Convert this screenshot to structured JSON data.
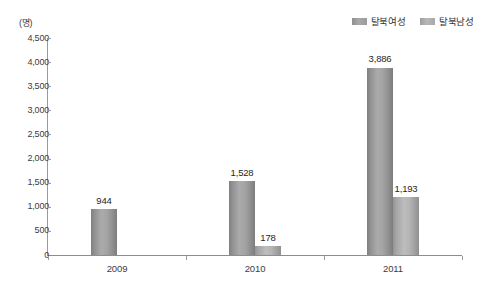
{
  "chart_data": {
    "type": "bar",
    "title": "",
    "xlabel": "",
    "ylabel": "(명)",
    "unit_label": "(명)",
    "categories": [
      "2009",
      "2010",
      "2011"
    ],
    "series": [
      {
        "name": "탈북여성",
        "color": "#a3a3a3",
        "values": [
          944,
          1528,
          3886
        ],
        "value_labels": [
          "944",
          "1,528",
          "3,886"
        ]
      },
      {
        "name": "탈북남성",
        "color": "#b4b4b4",
        "values": [
          null,
          178,
          1193
        ],
        "value_labels": [
          "",
          "178",
          "1,193"
        ]
      }
    ],
    "ylim": [
      0,
      4500
    ],
    "ytick_values": [
      4500,
      4000,
      3500,
      3000,
      2500,
      2000,
      1500,
      1000,
      500,
      0
    ],
    "ytick_labels": [
      "4,500",
      "4,000",
      "3,500",
      "3,000",
      "2,500",
      "2,000",
      "1,500",
      "1,000",
      "500",
      "0"
    ],
    "grid": false,
    "legend_position": "top-right"
  },
  "legend": {
    "items": [
      {
        "label": "탈북여성",
        "swatch": "legend-swatch-female"
      },
      {
        "label": "탈북남성",
        "swatch": "legend-swatch-male"
      }
    ]
  },
  "axes": {
    "unit": "(명)"
  }
}
